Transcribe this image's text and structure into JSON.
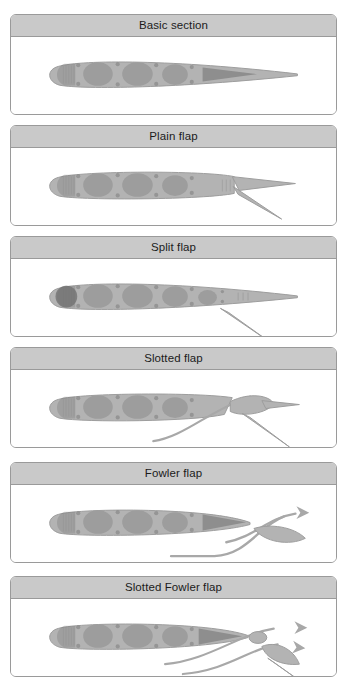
{
  "figure": {
    "kind": "airfoil-flap-types-diagram",
    "background_color": "#ffffff",
    "panel_border_color": "#9a9a9a",
    "title_bar_color": "#c9c9c9",
    "title_text_color": "#1b1b1b",
    "airfoil_fill_color": "#b3b3b3",
    "airfoil_stroke_color": "#9c9c9c",
    "hole_fill_color": "#9d9d9d",
    "rivet_fill_color": "#8f8f8f",
    "dark_wedge_color": "#6f6f6f",
    "streamline_color": "#a8a8a8"
  },
  "panels": [
    {
      "id": "basic-section",
      "title": "Basic section",
      "top": 14,
      "height": 101,
      "flap_type": "none",
      "has_streamline": false,
      "arrow_count": 0,
      "description": "Plain wing section with no flap deployed; sharp trailing edge intact."
    },
    {
      "id": "plain-flap",
      "title": "Plain flap",
      "top": 125,
      "height": 101,
      "flap_type": "plain",
      "has_streamline": false,
      "arrow_count": 0,
      "description": "Rear portion of the section hinged downward as one piece."
    },
    {
      "id": "split-flap",
      "title": "Split flap",
      "top": 236,
      "height": 101,
      "flap_type": "split",
      "has_streamline": false,
      "arrow_count": 0,
      "description": "Lower surface plate deflects down while the upper surface stays fixed."
    },
    {
      "id": "slotted-flap",
      "title": "Slotted flap",
      "top": 347,
      "height": 101,
      "flap_type": "slotted",
      "has_streamline": true,
      "arrow_count": 0,
      "description": "Flap deflects with a gap so air flows through the slot over the flap."
    },
    {
      "id": "fowler-flap",
      "title": "Fowler flap",
      "top": 462,
      "height": 101,
      "flap_type": "fowler",
      "has_streamline": true,
      "arrow_count": 1,
      "description": "Flap translates aft and down, separated from the main section."
    },
    {
      "id": "slotted-fowler-flap",
      "title": "Slotted Fowler flap",
      "top": 576,
      "height": 101,
      "flap_type": "slotted-fowler",
      "has_streamline": true,
      "arrow_count": 2,
      "description": "Fowler flap with a vane creating multiple slots for airflow."
    }
  ]
}
